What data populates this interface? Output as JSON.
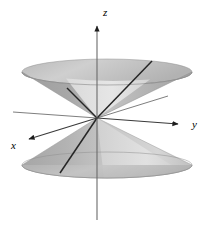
{
  "figure": {
    "background_color": "#ffffff",
    "width": 209,
    "height": 226
  },
  "axes": {
    "origin": {
      "x": 97,
      "y": 118
    },
    "items": [
      {
        "name": "z",
        "label": "z",
        "label_x": 103,
        "label_y": 14,
        "direction": "up",
        "arrow": true,
        "line": {
          "x1": 97,
          "y1": 218,
          "x2": 97,
          "y2": 24
        },
        "color": "#555555"
      },
      {
        "name": "y",
        "label": "y",
        "label_x": 196,
        "label_y": 128,
        "direction": "right-down",
        "arrow": true,
        "line": {
          "x1": 97,
          "y1": 118,
          "x2": 180,
          "y2": 124
        },
        "color": "#444444"
      },
      {
        "name": "x",
        "label": "x",
        "label_x": 14,
        "label_y": 147,
        "direction": "left-down",
        "arrow": true,
        "line": {
          "x1": 97,
          "y1": 118,
          "x2": 27,
          "y2": 140
        },
        "color": "#444444"
      }
    ],
    "negative_extensions": [
      {
        "name": "negative-y-extension",
        "line": {
          "x1": 97,
          "y1": 118,
          "x2": 14,
          "y2": 112
        },
        "color": "#777777"
      },
      {
        "name": "negative-x-extension",
        "line": {
          "x1": 97,
          "y1": 118,
          "x2": 167,
          "y2": 96
        },
        "color": "#777777"
      }
    ]
  },
  "cones": {
    "upper": {
      "name": "upper-cone",
      "apex": {
        "x": 97,
        "y": 118
      },
      "rim_center": {
        "x": 107,
        "y": 72
      },
      "rim_rx": 85,
      "rim_ry": 13,
      "fill_outer": "#a3a3a3",
      "fill_inner": "#dedede",
      "edge_color": "#8d8d8d"
    },
    "lower": {
      "name": "lower-cone",
      "apex": {
        "x": 97,
        "y": 118
      },
      "rim_center": {
        "x": 107,
        "y": 165
      },
      "rim_rx": 85,
      "rim_ry": 13,
      "fill_outer": "#b0b0b0",
      "fill_inner": "#d9d9d9",
      "edge_color": "#9a9a9a"
    }
  },
  "rulings": [
    {
      "name": "ruling-upper-right",
      "line": {
        "x1": 97,
        "y1": 118,
        "x2": 152,
        "y2": 62
      },
      "color": "#2b2b2b"
    },
    {
      "name": "ruling-upper-left",
      "line": {
        "x1": 97,
        "y1": 118,
        "x2": 68,
        "y2": 88
      },
      "color": "#2b2b2b"
    },
    {
      "name": "ruling-lower-left",
      "line": {
        "x1": 97,
        "y1": 118,
        "x2": 61,
        "y2": 172
      },
      "color": "#2b2b2b"
    }
  ],
  "colors": {
    "axis_dark": "#444444",
    "axis_light": "#777777",
    "ruling": "#2b2b2b",
    "cone_gray": "#a3a3a3",
    "cone_light": "#dedede",
    "label_text": "#000000"
  }
}
